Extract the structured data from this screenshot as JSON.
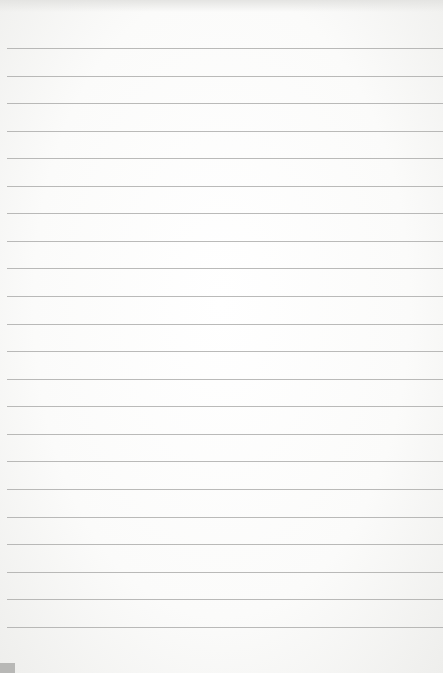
{
  "paper": {
    "type": "lined notepad page",
    "line_count": 22,
    "first_line_y": 48,
    "line_spacing": 27.56,
    "line_color": "#a9a9a7",
    "background_color": "#ffffff"
  }
}
